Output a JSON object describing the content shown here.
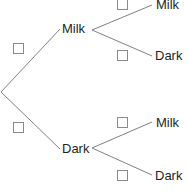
{
  "diagram": {
    "type": "probability-tree-diagram",
    "line_color": "#808080",
    "box_border_color": "#8a8a8a",
    "text_color": "#231f20",
    "background_color": "#ffffff",
    "root": {
      "name": "root-node",
      "x": 1,
      "y": 92
    },
    "branches": [
      {
        "name": "branch-root-to-milk",
        "from": [
          1,
          92
        ],
        "to": [
          60,
          29
        ],
        "probability_box": {
          "name": "prob-box-milk-first",
          "x": 13,
          "y": 43,
          "value": ""
        }
      },
      {
        "name": "branch-root-to-dark",
        "from": [
          1,
          92
        ],
        "to": [
          60,
          149
        ],
        "probability_box": {
          "name": "prob-box-dark-first",
          "x": 13,
          "y": 122,
          "value": ""
        }
      },
      {
        "name": "branch-milk-to-milk",
        "from": [
          92,
          30
        ],
        "to": [
          152,
          5
        ],
        "probability_box": {
          "name": "prob-box-milk-milk",
          "x": 117,
          "y": -1,
          "value": ""
        }
      },
      {
        "name": "branch-milk-to-dark",
        "from": [
          92,
          30
        ],
        "to": [
          152,
          56
        ],
        "probability_box": {
          "name": "prob-box-milk-dark",
          "x": 117,
          "y": 50,
          "value": ""
        }
      },
      {
        "name": "branch-dark-to-milk",
        "from": [
          92,
          148
        ],
        "to": [
          152,
          122
        ],
        "probability_box": {
          "name": "prob-box-dark-milk",
          "x": 117,
          "y": 117,
          "value": ""
        }
      },
      {
        "name": "branch-dark-to-dark",
        "from": [
          92,
          148
        ],
        "to": [
          152,
          175
        ],
        "probability_box": {
          "name": "prob-box-dark-dark",
          "x": 117,
          "y": 170,
          "value": ""
        }
      }
    ],
    "labels": [
      {
        "name": "label-first-milk",
        "text": "Milk",
        "x": 62,
        "y": 22
      },
      {
        "name": "label-first-dark",
        "text": "Dark",
        "x": 62,
        "y": 142
      },
      {
        "name": "label-second-milk-milk",
        "text": "Milk",
        "x": 156,
        "y": -2
      },
      {
        "name": "label-second-milk-dark",
        "text": "Dark",
        "x": 155,
        "y": 49
      },
      {
        "name": "label-second-dark-milk",
        "text": "Milk",
        "x": 156,
        "y": 116
      },
      {
        "name": "label-second-dark-dark",
        "text": "Dark",
        "x": 155,
        "y": 169
      }
    ]
  }
}
